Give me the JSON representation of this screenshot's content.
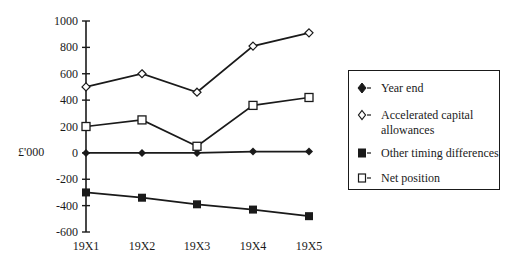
{
  "chart_data": {
    "type": "line",
    "title": "",
    "xlabel": "",
    "ylabel": "£'000",
    "ylim": [
      -600,
      1000
    ],
    "yticks": [
      1000,
      800,
      600,
      400,
      200,
      0,
      -200,
      -400,
      -600
    ],
    "categories": [
      "19X1",
      "19X2",
      "19X3",
      "19X4",
      "19X5"
    ],
    "grid": false,
    "legend_position": "right",
    "series": [
      {
        "name": "Year end",
        "marker": "filled-diamond",
        "values": [
          0,
          0,
          0,
          10,
          10
        ]
      },
      {
        "name": "Accelerated capital allowances",
        "marker": "open-diamond",
        "values": [
          500,
          600,
          460,
          810,
          910
        ]
      },
      {
        "name": "Other timing differences",
        "marker": "filled-square",
        "values": [
          -300,
          -340,
          -390,
          -430,
          -480
        ]
      },
      {
        "name": "Net position",
        "marker": "open-square",
        "values": [
          200,
          250,
          50,
          360,
          420
        ]
      }
    ]
  },
  "axis": {
    "y_label": "£'000",
    "y_ticks": [
      "1000",
      "800",
      "600",
      "400",
      "200",
      "0",
      "-200",
      "-400",
      "-600"
    ],
    "x_ticks": [
      "19X1",
      "19X2",
      "19X3",
      "19X4",
      "19X5"
    ]
  },
  "legend": {
    "items": [
      {
        "label_line1": "Year end",
        "label_line2": ""
      },
      {
        "label_line1": "Accelerated capital",
        "label_line2": "allowances"
      },
      {
        "label_line1": "Other timing differences",
        "label_line2": ""
      },
      {
        "label_line1": "Net position",
        "label_line2": ""
      }
    ]
  }
}
